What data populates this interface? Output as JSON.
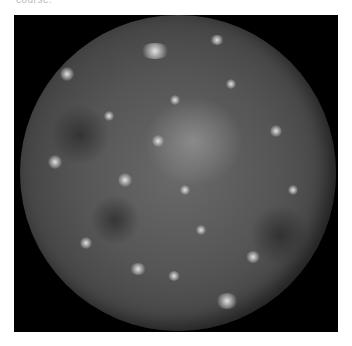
{
  "caption": {
    "text": "course."
  },
  "image": {
    "subject": "moon-callisto",
    "frame_color": "#000000",
    "surface_color": "#555555",
    "highlight_color": "#e6e6e6"
  }
}
